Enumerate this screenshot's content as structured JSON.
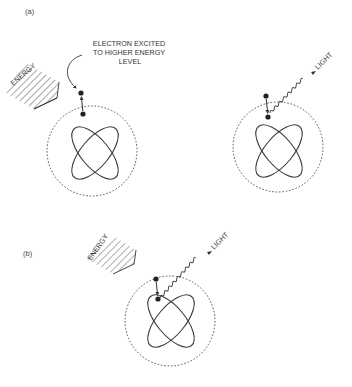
{
  "diagram": {
    "panels": [
      {
        "id": "a",
        "label": "(a)",
        "atoms": [
          {
            "role": "absorption",
            "energy_label": "ENERGY",
            "annotation": [
              "ELECTRON EXCITED",
              "TO HIGHER ENERGY",
              "LEVEL"
            ]
          },
          {
            "role": "emission",
            "light_label": "LIGHT"
          }
        ]
      },
      {
        "id": "b",
        "label": "(b)",
        "atoms": [
          {
            "role": "absorption-and-emission",
            "energy_label": "ENERGY",
            "light_label": "LIGHT"
          }
        ]
      }
    ],
    "colors": {
      "line": "#333333",
      "background": "#ffffff"
    }
  }
}
